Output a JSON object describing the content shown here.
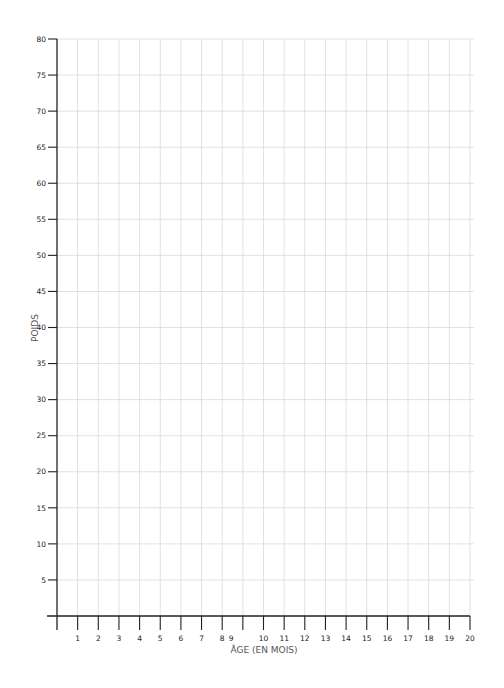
{
  "chart_data": {
    "type": "line",
    "title": "",
    "xlabel": "ÂGE (EN MOIS)",
    "ylabel": "POIDS",
    "xlim": [
      0,
      20
    ],
    "ylim": [
      0,
      80
    ],
    "x_ticks": [
      1,
      2,
      3,
      4,
      5,
      6,
      7,
      8,
      9,
      10,
      11,
      12,
      13,
      14,
      15,
      16,
      17,
      18,
      19,
      20
    ],
    "x_tick_labels": [
      "1",
      "2",
      "3",
      "4",
      "5",
      "6",
      "7",
      "8",
      "9",
      "10",
      "11",
      "12",
      "13",
      "14",
      "15",
      "16",
      "17",
      "18",
      "19",
      "20"
    ],
    "y_ticks": [
      5,
      10,
      15,
      20,
      25,
      30,
      35,
      40,
      45,
      50,
      55,
      60,
      65,
      70,
      75,
      80
    ],
    "y_tick_labels": [
      "5",
      "10",
      "15",
      "20",
      "25",
      "30",
      "35",
      "40",
      "45",
      "50",
      "55",
      "60",
      "65",
      "70",
      "75",
      "80"
    ],
    "grid": true,
    "series": [],
    "legend": null
  },
  "colors": {
    "axis": "#222222",
    "grid": "#d9d9d9",
    "axis_title": "#555555"
  }
}
